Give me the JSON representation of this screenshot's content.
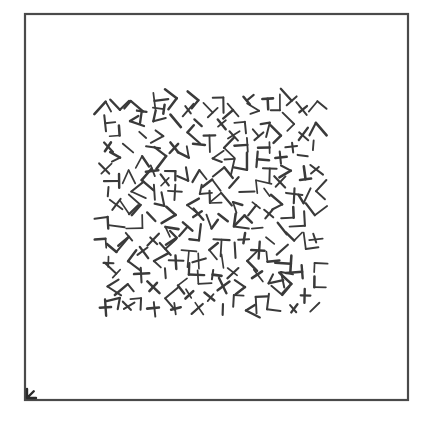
{
  "figure": {
    "domain_kind": "scanned-figure",
    "caption": "",
    "background_color": "#ffffff",
    "ink_color": "#3a3a3a",
    "canvas": {
      "width": 438,
      "height": 424
    }
  },
  "frame": {
    "name": "outer-rectangle-frame",
    "x": 25,
    "y": 14,
    "width": 383,
    "height": 386,
    "stroke_color": "#4a4a4a",
    "stroke_width": 2.2,
    "fill": "none"
  },
  "corner_mark": {
    "name": "bottom-left-arrow-tick",
    "x": 27,
    "y": 398,
    "size": 9,
    "direction": "down-left",
    "stroke_color": "#2b2b2b",
    "stroke_width": 2.4
  },
  "texture_patch": {
    "name": "texton-texture-patch",
    "x": 100,
    "y": 88,
    "width": 222,
    "height": 232,
    "lattice": {
      "type": "diagonal",
      "rotation_deg": 45,
      "spacing": 16.4,
      "jitter": 2.1
    },
    "element": {
      "type": "line-segment-pair",
      "arm_length_min": 9,
      "arm_length_max": 17,
      "stroke_width": 2.0,
      "stroke_color": "#3a3a3a",
      "shapes": [
        "L",
        "T",
        "V",
        "X",
        "plus",
        "single-dash",
        "corner",
        "Y"
      ]
    },
    "seed": 20250614,
    "element_count": 232
  },
  "chart_data": {
    "type": "scatter",
    "title": "",
    "xlabel": "",
    "ylabel": ""
  }
}
